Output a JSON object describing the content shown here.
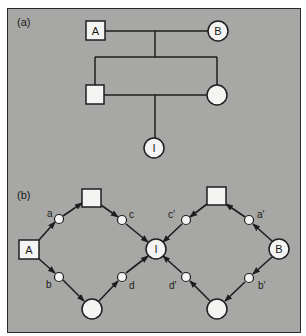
{
  "panel_a": {
    "label": "(a)",
    "nodes": {
      "A": {
        "text": "A",
        "shape": "square"
      },
      "B": {
        "text": "B",
        "shape": "circle"
      },
      "son": {
        "text": "",
        "shape": "square"
      },
      "daughter": {
        "text": "",
        "shape": "circle"
      },
      "I": {
        "text": "I",
        "shape": "circle"
      }
    }
  },
  "panel_b": {
    "label": "(b)",
    "nodes": {
      "A": {
        "text": "A",
        "shape": "square"
      },
      "B": {
        "text": "B",
        "shape": "circle"
      },
      "I": {
        "text": "I",
        "shape": "circle"
      },
      "left_square": {
        "text": "",
        "shape": "square"
      },
      "left_circle": {
        "text": "",
        "shape": "circle"
      },
      "right_square": {
        "text": "",
        "shape": "square"
      },
      "right_circle": {
        "text": "",
        "shape": "circle"
      }
    },
    "path_labels": {
      "a": "a",
      "b": "b",
      "c": "c",
      "d": "d",
      "a_prime": "a′",
      "b_prime": "b′",
      "c_prime": "c′",
      "d_prime": "d′"
    }
  },
  "colors": {
    "background": "#a7a7a5",
    "node_fill": "#f4f4f2",
    "stroke": "#1e1e1e"
  }
}
